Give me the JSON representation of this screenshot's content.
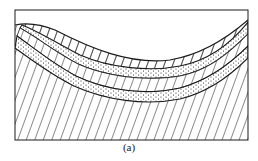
{
  "figure": {
    "type": "geological-cross-section",
    "caption": "(a)",
    "colors": {
      "line": "#1a1a1a",
      "background": "#ffffff"
    }
  }
}
